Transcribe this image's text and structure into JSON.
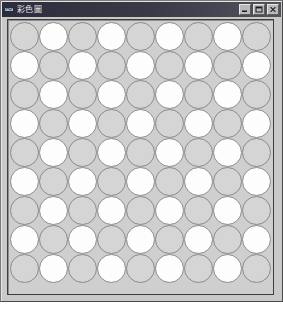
{
  "window": {
    "title": "彩色圖",
    "icon": "app-icon",
    "controls": [
      {
        "name": "minimize-button",
        "label": "Minimize",
        "glyph": "minimize-icon"
      },
      {
        "name": "maximize-button",
        "label": "Maximize",
        "glyph": "maximize-icon"
      },
      {
        "name": "close-button",
        "label": "Close",
        "glyph": "close-icon"
      }
    ]
  },
  "grid": {
    "rows": 9,
    "columns": 9,
    "cell_size": 29,
    "shape": "circle",
    "pattern": "checkerboard",
    "colors": {
      "gray": "#d5d5d5",
      "white": "#fdfdfd",
      "outline": "#8a8a8a",
      "panel_background": "#cfcfcf",
      "panel_border": "#3d3d3d"
    },
    "cells": [
      [
        "gray",
        "white",
        "gray",
        "white",
        "gray",
        "white",
        "gray",
        "white",
        "gray"
      ],
      [
        "white",
        "gray",
        "white",
        "gray",
        "white",
        "gray",
        "white",
        "gray",
        "white"
      ],
      [
        "gray",
        "white",
        "gray",
        "white",
        "gray",
        "white",
        "gray",
        "white",
        "gray"
      ],
      [
        "white",
        "gray",
        "white",
        "gray",
        "white",
        "gray",
        "white",
        "gray",
        "white"
      ],
      [
        "gray",
        "white",
        "gray",
        "white",
        "gray",
        "white",
        "gray",
        "white",
        "gray"
      ],
      [
        "white",
        "gray",
        "white",
        "gray",
        "white",
        "gray",
        "white",
        "gray",
        "white"
      ],
      [
        "gray",
        "white",
        "gray",
        "white",
        "gray",
        "white",
        "gray",
        "white",
        "gray"
      ],
      [
        "white",
        "gray",
        "white",
        "gray",
        "white",
        "gray",
        "white",
        "gray",
        "white"
      ],
      [
        "gray",
        "white",
        "gray",
        "white",
        "gray",
        "white",
        "gray",
        "white",
        "gray"
      ]
    ]
  },
  "theme": {
    "titlebar_start": "#2c2c3c",
    "titlebar_end": "#53535e",
    "titlebar_text": "#e8e8ec",
    "window_face": "#c9c9c9"
  }
}
